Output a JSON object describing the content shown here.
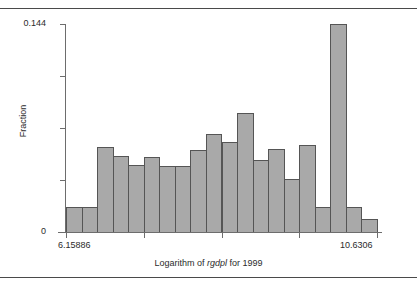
{
  "chart_data": {
    "type": "bar",
    "title": "",
    "subtitle": "",
    "xlabel_prefix": "Logarithm of ",
    "xlabel_emphasis": "rgdpl",
    "xlabel_suffix": " for 1999",
    "xlabel": "Logarithm of rgdpl for 1999",
    "ylabel": "Fraction",
    "ylim": [
      0,
      0.144
    ],
    "xlim": [
      6.15886,
      10.6306
    ],
    "y_tick_labels": [
      "0.144",
      "0"
    ],
    "y_tick_values": [
      0.144,
      0
    ],
    "y_minor_ticks": [
      0.108,
      0.072,
      0.036
    ],
    "x_tick_labels": [
      "6.15886",
      "10.6306"
    ],
    "x_tick_values": [
      6.15886,
      10.6306
    ],
    "x_minor_tick_values": [
      7.275,
      8.395,
      9.512
    ],
    "grid": false,
    "legend": null,
    "bar_fill_color": "#a9a9a9",
    "bar_border_color": "#555555",
    "axis_color": "#6d6d6d",
    "bin_count": 20,
    "bin_edges": [
      6.15886,
      6.38222,
      6.60559,
      6.82896,
      7.05233,
      7.27569,
      7.49906,
      7.72243,
      7.9458,
      8.16916,
      8.39253,
      8.6159,
      8.83927,
      9.06263,
      9.286,
      9.50937,
      9.73274,
      9.9561,
      10.17947,
      10.40284,
      10.6306
    ],
    "bin_centers": [
      6.2705,
      6.4939,
      6.7173,
      6.9406,
      7.164,
      7.3874,
      7.6107,
      7.8341,
      8.0575,
      8.2808,
      8.5042,
      8.7276,
      8.951,
      9.1743,
      9.3977,
      9.6211,
      9.8444,
      10.0678,
      10.2912,
      10.5145
    ],
    "values": [
      0.0173,
      0.0173,
      0.0588,
      0.0526,
      0.0464,
      0.0519,
      0.0457,
      0.0457,
      0.0567,
      0.0678,
      0.0623,
      0.0824,
      0.0498,
      0.0574,
      0.0367,
      0.0602,
      0.0173,
      0.144,
      0.0173,
      0.009
    ],
    "bar_pixel_tops": [
      207,
      207,
      147,
      156,
      165,
      157,
      166,
      166,
      150,
      134,
      142,
      113,
      160,
      148,
      178,
      141,
      207,
      24,
      207,
      219
    ]
  },
  "figure": {
    "border_top": true,
    "border_bottom": true
  }
}
